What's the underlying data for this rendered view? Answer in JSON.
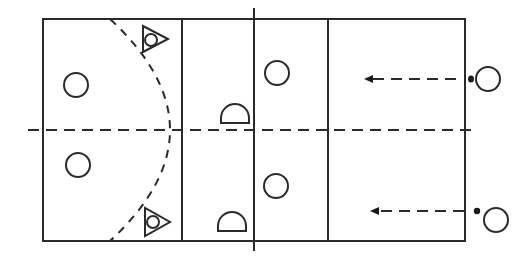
{
  "diagram": {
    "colors": {
      "ink": "#2a2a2a",
      "background": "#ffffff"
    },
    "court": {
      "zones": 4,
      "midline": "dashed",
      "center_line": "solid extended"
    },
    "players": [
      {
        "id": "p1",
        "type": "circle",
        "side": "left",
        "zone": "back"
      },
      {
        "id": "p2",
        "type": "circle",
        "side": "left",
        "zone": "back"
      },
      {
        "id": "p3",
        "type": "circle",
        "side": "right",
        "zone": "front"
      },
      {
        "id": "p4",
        "type": "circle",
        "side": "right",
        "zone": "front"
      },
      {
        "id": "p5",
        "type": "circle",
        "side": "outside-right",
        "has_ball": true
      },
      {
        "id": "p6",
        "type": "circle",
        "side": "outside-right",
        "has_ball": true
      }
    ],
    "markers": [
      {
        "id": "m1",
        "type": "triangle-circle"
      },
      {
        "id": "m2",
        "type": "triangle-circle"
      },
      {
        "id": "m3",
        "type": "half-circle"
      },
      {
        "id": "m4",
        "type": "half-circle"
      }
    ],
    "arrows": [
      {
        "id": "a1",
        "style": "dashed",
        "direction": "left"
      },
      {
        "id": "a2",
        "style": "dashed",
        "direction": "left"
      }
    ]
  }
}
